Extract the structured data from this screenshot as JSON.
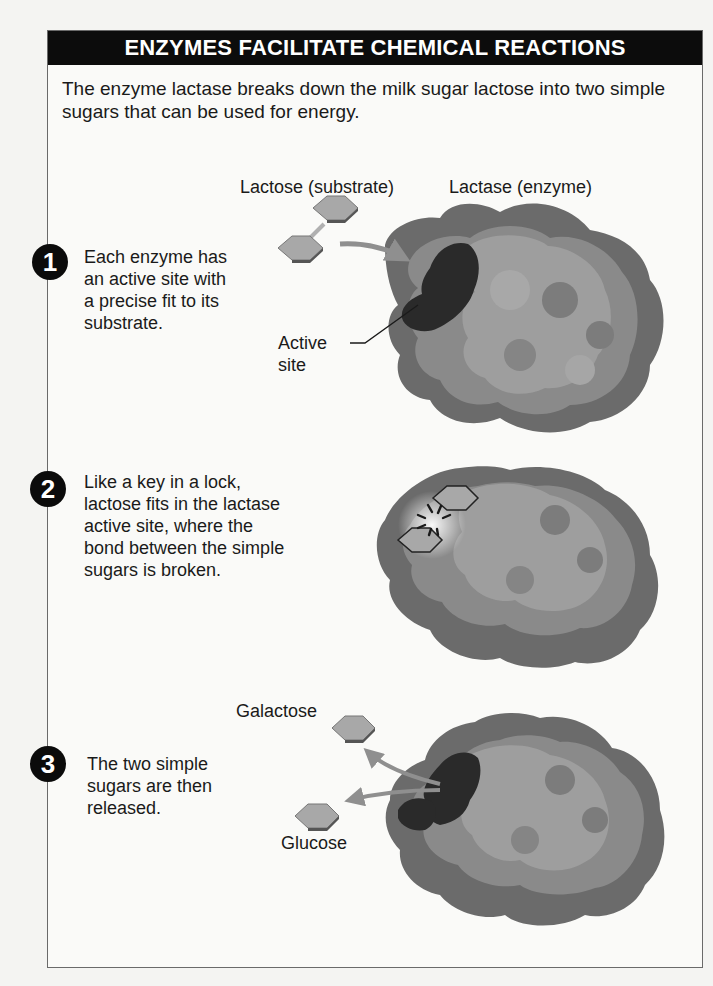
{
  "figure": {
    "title": "ENZYMES FACILITATE CHEMICAL REACTIONS",
    "intro": "The enzyme lactase breaks down the milk sugar lactose into two simple sugars that can be used for energy.",
    "labels": {
      "substrate": "Lactose (substrate)",
      "enzyme": "Lactase (enzyme)",
      "active_site_line1": "Active",
      "active_site_line2": "site",
      "galactose": "Galactose",
      "glucose": "Glucose"
    },
    "steps": [
      {
        "number": "1",
        "text": [
          "Each enzyme has",
          "an active site with",
          "a precise fit to its",
          "substrate."
        ]
      },
      {
        "number": "2",
        "text": [
          "Like a key in a lock,",
          "lactose fits in the lactase",
          "active site, where the",
          "bond between the simple",
          "sugars is broken."
        ]
      },
      {
        "number": "3",
        "text": [
          "The two simple",
          "sugars are then",
          "released."
        ]
      }
    ],
    "colors": {
      "header_bg": "#0c0c0c",
      "enzyme_dark_rim": "#6b6b6b",
      "enzyme_mid": "#8a8a8a",
      "enzyme_light": "#9e9e9e",
      "active_site": "#2a2a2a",
      "sugar": "#a8a8a8"
    }
  }
}
